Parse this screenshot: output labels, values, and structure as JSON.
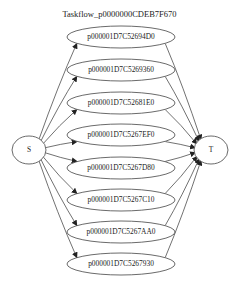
{
  "graph": {
    "title": "Taskflow_p0000000CDEB7F670",
    "source": {
      "id": "S",
      "label": "S",
      "cx": 29,
      "cy": 150,
      "rx": 17,
      "ry": 14
    },
    "sink": {
      "id": "T",
      "label": "T",
      "cx": 211,
      "cy": 150,
      "rx": 17,
      "ry": 14
    },
    "tasks": [
      {
        "label": "p000001D7C52694D0",
        "cx": 121,
        "cy": 37
      },
      {
        "label": "p000001D7C5269360",
        "cx": 121,
        "cy": 70
      },
      {
        "label": "p000001D7C52681E0",
        "cx": 121,
        "cy": 103
      },
      {
        "label": "p000001D7C5267EF0",
        "cx": 121,
        "cy": 135
      },
      {
        "label": "p000001D7C5267D80",
        "cx": 121,
        "cy": 168
      },
      {
        "label": "p000001D7C5267C10",
        "cx": 121,
        "cy": 200
      },
      {
        "label": "p000001D7C5267AA0",
        "cx": 121,
        "cy": 232
      },
      {
        "label": "p000001D7C5267930",
        "cx": 121,
        "cy": 264
      }
    ],
    "task_rx": 54,
    "task_ry": 11,
    "edge_color": "#333333",
    "node_stroke": "#444444"
  }
}
